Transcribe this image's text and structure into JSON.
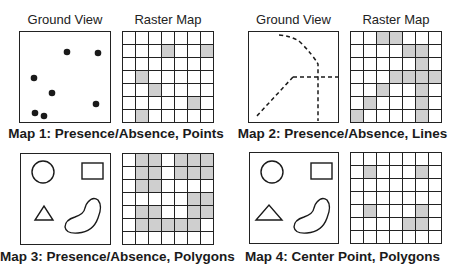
{
  "headers": {
    "ground_view": "Ground View",
    "raster_map": "Raster Map"
  },
  "colors": {
    "border": "#222222",
    "shaded_cell": "#cfcfcf",
    "empty_cell": "#ffffff"
  },
  "maps": [
    {
      "caption": "Map 1: Presence/Absence, Points",
      "ground_view_type": "points",
      "grid_size": 7,
      "shaded_cells": [
        [
          1,
          3
        ],
        [
          1,
          6
        ],
        [
          3,
          1
        ],
        [
          4,
          2
        ],
        [
          5,
          5
        ],
        [
          6,
          1
        ]
      ]
    },
    {
      "caption": "Map 2: Presence/Absence, Lines",
      "ground_view_type": "dashed-lines",
      "grid_size": 7,
      "shaded_cells": [
        [
          0,
          2
        ],
        [
          0,
          3
        ],
        [
          1,
          4
        ],
        [
          1,
          5
        ],
        [
          2,
          5
        ],
        [
          3,
          3
        ],
        [
          3,
          4
        ],
        [
          3,
          5
        ],
        [
          3,
          6
        ],
        [
          4,
          2
        ],
        [
          4,
          5
        ],
        [
          5,
          1
        ],
        [
          5,
          5
        ],
        [
          6,
          0
        ],
        [
          6,
          5
        ]
      ]
    },
    {
      "caption": "Map 3: Presence/Absence, Polygons",
      "ground_view_type": "polygons",
      "grid_size": 7,
      "shaded_cells": [
        [
          0,
          1
        ],
        [
          0,
          2
        ],
        [
          0,
          4
        ],
        [
          0,
          5
        ],
        [
          0,
          6
        ],
        [
          1,
          1
        ],
        [
          1,
          2
        ],
        [
          1,
          4
        ],
        [
          1,
          5
        ],
        [
          1,
          6
        ],
        [
          2,
          1
        ],
        [
          2,
          2
        ],
        [
          3,
          5
        ],
        [
          3,
          6
        ],
        [
          4,
          1
        ],
        [
          4,
          2
        ],
        [
          4,
          5
        ],
        [
          4,
          6
        ],
        [
          5,
          1
        ],
        [
          5,
          2
        ],
        [
          5,
          3
        ],
        [
          5,
          4
        ],
        [
          5,
          5
        ]
      ]
    },
    {
      "caption": "Map 4: Center Point, Polygons",
      "ground_view_type": "polygons",
      "grid_size": 7,
      "shaded_cells": [
        [
          1,
          1
        ],
        [
          1,
          5
        ],
        [
          4,
          1
        ],
        [
          4,
          5
        ],
        [
          5,
          4
        ],
        [
          5,
          5
        ]
      ]
    }
  ]
}
